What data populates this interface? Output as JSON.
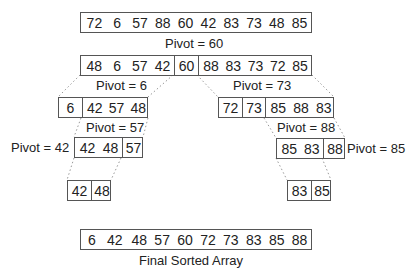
{
  "diagram": {
    "initial_array": [
      "72",
      "6",
      "57",
      "88",
      "60",
      "42",
      "83",
      "73",
      "48",
      "85"
    ],
    "pivot_labels": {
      "p60": "Pivot = 60",
      "p6": "Pivot = 6",
      "p73": "Pivot = 73",
      "p57": "Pivot = 57",
      "p88": "Pivot = 88",
      "p42": "Pivot = 42",
      "p85": "Pivot = 85"
    },
    "level1": {
      "left": [
        "48",
        "6",
        "57",
        "42"
      ],
      "pivot": [
        "60"
      ],
      "right": [
        "88",
        "83",
        "73",
        "72",
        "85"
      ]
    },
    "level2_left": {
      "pivot": [
        "6"
      ],
      "right": [
        "42",
        "57",
        "48"
      ]
    },
    "level2_right": {
      "left": [
        "72"
      ],
      "pivot": [
        "73"
      ],
      "right": [
        "85",
        "88",
        "83"
      ]
    },
    "level3_left": {
      "left": [
        "42",
        "48"
      ],
      "pivot": [
        "57"
      ]
    },
    "level3_right": {
      "left": [
        "85",
        "83"
      ],
      "pivot": [
        "88"
      ]
    },
    "level4_left": [
      "42",
      "48"
    ],
    "level4_right": [
      "83",
      "85"
    ],
    "final_array": [
      "6",
      "42",
      "48",
      "57",
      "60",
      "72",
      "73",
      "83",
      "85",
      "88"
    ],
    "final_label": "Final Sorted Array"
  }
}
